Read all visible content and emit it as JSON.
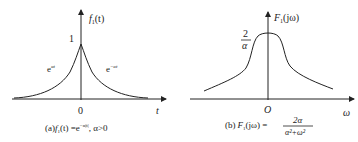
{
  "left_panel": {
    "y_axis_label": "f",
    "y_axis_sub": "1",
    "y_axis_arg": "(t)",
    "peak_label": "1",
    "left_curve_label": "e",
    "left_curve_exp": "αt",
    "right_curve_label": "e",
    "right_curve_exp": "−αt",
    "origin_label": "0",
    "x_axis_label": "t",
    "caption_prefix": "(a)",
    "caption_f": "f",
    "caption_sub": "1",
    "caption_arg": "(t) =e",
    "caption_exp": "−α|t|",
    "caption_cond": ", α>0"
  },
  "right_panel": {
    "y_axis_label": "F",
    "y_axis_sub": "1",
    "y_axis_arg": "(jω)",
    "peak_num": "2",
    "peak_den": "α",
    "origin_label": "O",
    "x_axis_label": "ω",
    "caption_prefix": "(b)",
    "caption_F": "F",
    "caption_sub": "1",
    "caption_arg": "(jω) =",
    "caption_num": "2α",
    "caption_den": "α²+ω²"
  },
  "colors": {
    "ink": "#222222",
    "background": "#ffffff"
  }
}
